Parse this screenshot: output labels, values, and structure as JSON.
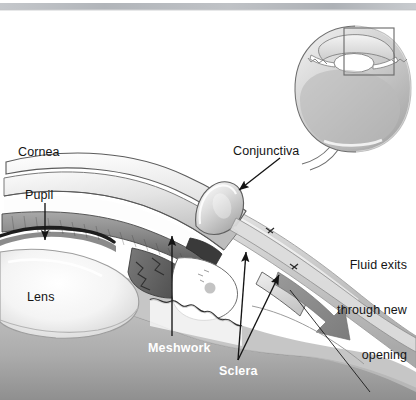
{
  "figure": {
    "style": "grayscale medical illustration",
    "width": 416,
    "height": 400,
    "background_color": "#ffffff",
    "top_scan_band_color": "#b9bcc0"
  },
  "labels": {
    "cornea": "Cornea",
    "pupil": "Pupil",
    "lens": "Lens",
    "conjunctiva": "Conjunctiva",
    "meshwork": "Meshwork",
    "sclera": "Sclera",
    "fluid_line1": "Fluid exits",
    "fluid_line2": "through new",
    "fluid_line3": "opening"
  },
  "colors": {
    "ink": "#141414",
    "label_white": "#ffffff",
    "sclera_gray": "#b5b5b5",
    "sclera_gray_dark": "#9a9a9a",
    "cornea_light": "#f2f2f2",
    "iris_gray": "#8e8e8e",
    "iris_dark": "#5a5a5a",
    "lens_light": "#f6f6f6",
    "flow_arrow": "#8f8f8f",
    "inset_body": "#c9c9c9",
    "inset_outline": "#6e6e6e",
    "callout_box": "#6e6e6e"
  },
  "inset": {
    "name": "whole-eye locator diagram",
    "position": "top-right",
    "callout_box": {
      "x": 344,
      "y": 28,
      "width": 50,
      "height": 47
    },
    "parts": [
      "cornea",
      "lens",
      "iris",
      "vitreous body",
      "sclera",
      "optic nerve"
    ]
  },
  "annotations": [
    {
      "name": "cornea-label",
      "text": "Cornea",
      "x": 18,
      "y": 145,
      "pointer": "none"
    },
    {
      "name": "pupil-label",
      "text": "Pupil",
      "x": 25,
      "y": 188,
      "pointer": "arrow-down"
    },
    {
      "name": "lens-label",
      "text": "Lens",
      "x": 27,
      "y": 290,
      "pointer": "none"
    },
    {
      "name": "conjunctiva-label",
      "text": "Conjunctiva",
      "x": 233,
      "y": 144,
      "pointer": "arrow-down-left"
    },
    {
      "name": "meshwork-label",
      "text": "Meshwork",
      "x": 148,
      "y": 341,
      "pointer": "arrow-up"
    },
    {
      "name": "sclera-label",
      "text": "Sclera",
      "x": 219,
      "y": 364,
      "pointer": "two-arrows-up"
    },
    {
      "name": "fluid-exits-label",
      "text": "Fluid exits through new opening",
      "x": 311,
      "y": 228,
      "pointer": "large-flow-arrow"
    }
  ]
}
